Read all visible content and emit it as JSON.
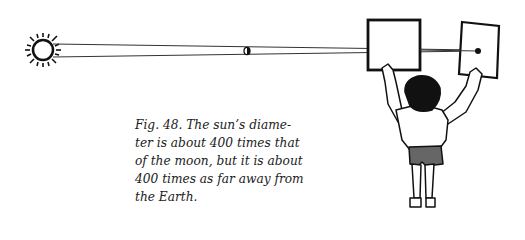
{
  "figure": {
    "label": "Fig. 48.",
    "caption_lines": [
      "Fig. 48.   The sun’s diame-",
      "ter is about 400 times that",
      "of the moon, but it is about",
      "400 times as far away from",
      "the Earth."
    ],
    "elements": [
      "sun",
      "moon",
      "light-rays",
      "left-card",
      "right-card",
      "child-holding-cards"
    ]
  }
}
